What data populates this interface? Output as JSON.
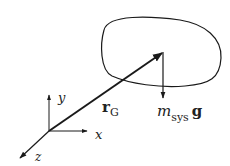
{
  "diagram": {
    "title": "",
    "colors": {
      "stroke": "#1a1a1a",
      "text": "#222222",
      "background": "#ffffff"
    },
    "axes": {
      "x_label": "x",
      "y_label": "y",
      "z_label": "z"
    },
    "vectors": {
      "position": {
        "symbol": "r",
        "subscript": "G"
      },
      "weight": {
        "mass_symbol": "m",
        "mass_subscript": "sys",
        "gravity_symbol": "g"
      }
    },
    "body": {
      "shape": "closed-blob"
    }
  }
}
